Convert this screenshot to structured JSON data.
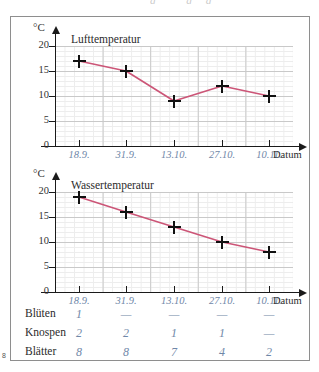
{
  "page": {
    "number_marker": "8",
    "top_ghost": "g gg"
  },
  "charts": [
    {
      "id": "air",
      "unit": "°C",
      "title": "Lufttemperatur",
      "x_axis_name": "Datum",
      "y_ticks": [
        "0",
        "5",
        "10",
        "15",
        "20"
      ],
      "x_ticks": [
        "18.9.",
        "31.9.",
        "13.10.",
        "27.10.",
        "10.11."
      ],
      "values": [
        17,
        15,
        9,
        12,
        10
      ],
      "line_color": "#cc5577"
    },
    {
      "id": "water",
      "unit": "°C",
      "title": "Wassertemperatur",
      "x_axis_name": "Datum",
      "y_ticks": [
        "0",
        "5",
        "10",
        "15",
        "20"
      ],
      "x_ticks": [
        "18.9.",
        "31.9.",
        "13.10.",
        "27.10.",
        "10.11."
      ],
      "values": [
        19,
        16,
        13,
        10,
        8
      ],
      "line_color": "#cc5577"
    }
  ],
  "chart_data": [
    {
      "type": "line",
      "title": "Lufttemperatur",
      "xlabel": "Datum",
      "ylabel": "°C",
      "categories": [
        "18.9.",
        "31.9.",
        "13.10.",
        "27.10.",
        "10.11."
      ],
      "values": [
        17,
        15,
        9,
        12,
        10
      ],
      "ylim": [
        0,
        22
      ],
      "yticks": [
        0,
        5,
        10,
        15,
        20
      ],
      "grid": true,
      "legend": "none",
      "marker": "plus",
      "line_color": "#cc5577"
    },
    {
      "type": "line",
      "title": "Wassertemperatur",
      "xlabel": "Datum",
      "ylabel": "°C",
      "categories": [
        "18.9.",
        "31.9.",
        "13.10.",
        "27.10.",
        "10.11."
      ],
      "values": [
        19,
        16,
        13,
        10,
        8
      ],
      "ylim": [
        0,
        22
      ],
      "yticks": [
        0,
        5,
        10,
        15,
        20
      ],
      "grid": true,
      "legend": "none",
      "marker": "plus",
      "line_color": "#cc5577"
    },
    {
      "type": "table",
      "title": "Beobachtungstabelle",
      "row_headers": [
        "Blüten",
        "Knospen",
        "Blätter"
      ],
      "column_headers": [
        "18.9.",
        "31.9.",
        "13.10.",
        "27.10.",
        "10.11."
      ],
      "rows": [
        [
          "1",
          "—",
          "—",
          "—",
          "—"
        ],
        [
          "2",
          "2",
          "1",
          "1",
          "—"
        ],
        [
          "8",
          "8",
          "7",
          "4",
          "2"
        ]
      ]
    }
  ],
  "table": {
    "rows": [
      {
        "label": "Blüten",
        "cells": [
          "1",
          "—",
          "—",
          "—",
          "—"
        ]
      },
      {
        "label": "Knospen",
        "cells": [
          "2",
          "2",
          "1",
          "1",
          "—"
        ]
      },
      {
        "label": "Blätter",
        "cells": [
          "8",
          "8",
          "7",
          "4",
          "2"
        ]
      }
    ]
  }
}
